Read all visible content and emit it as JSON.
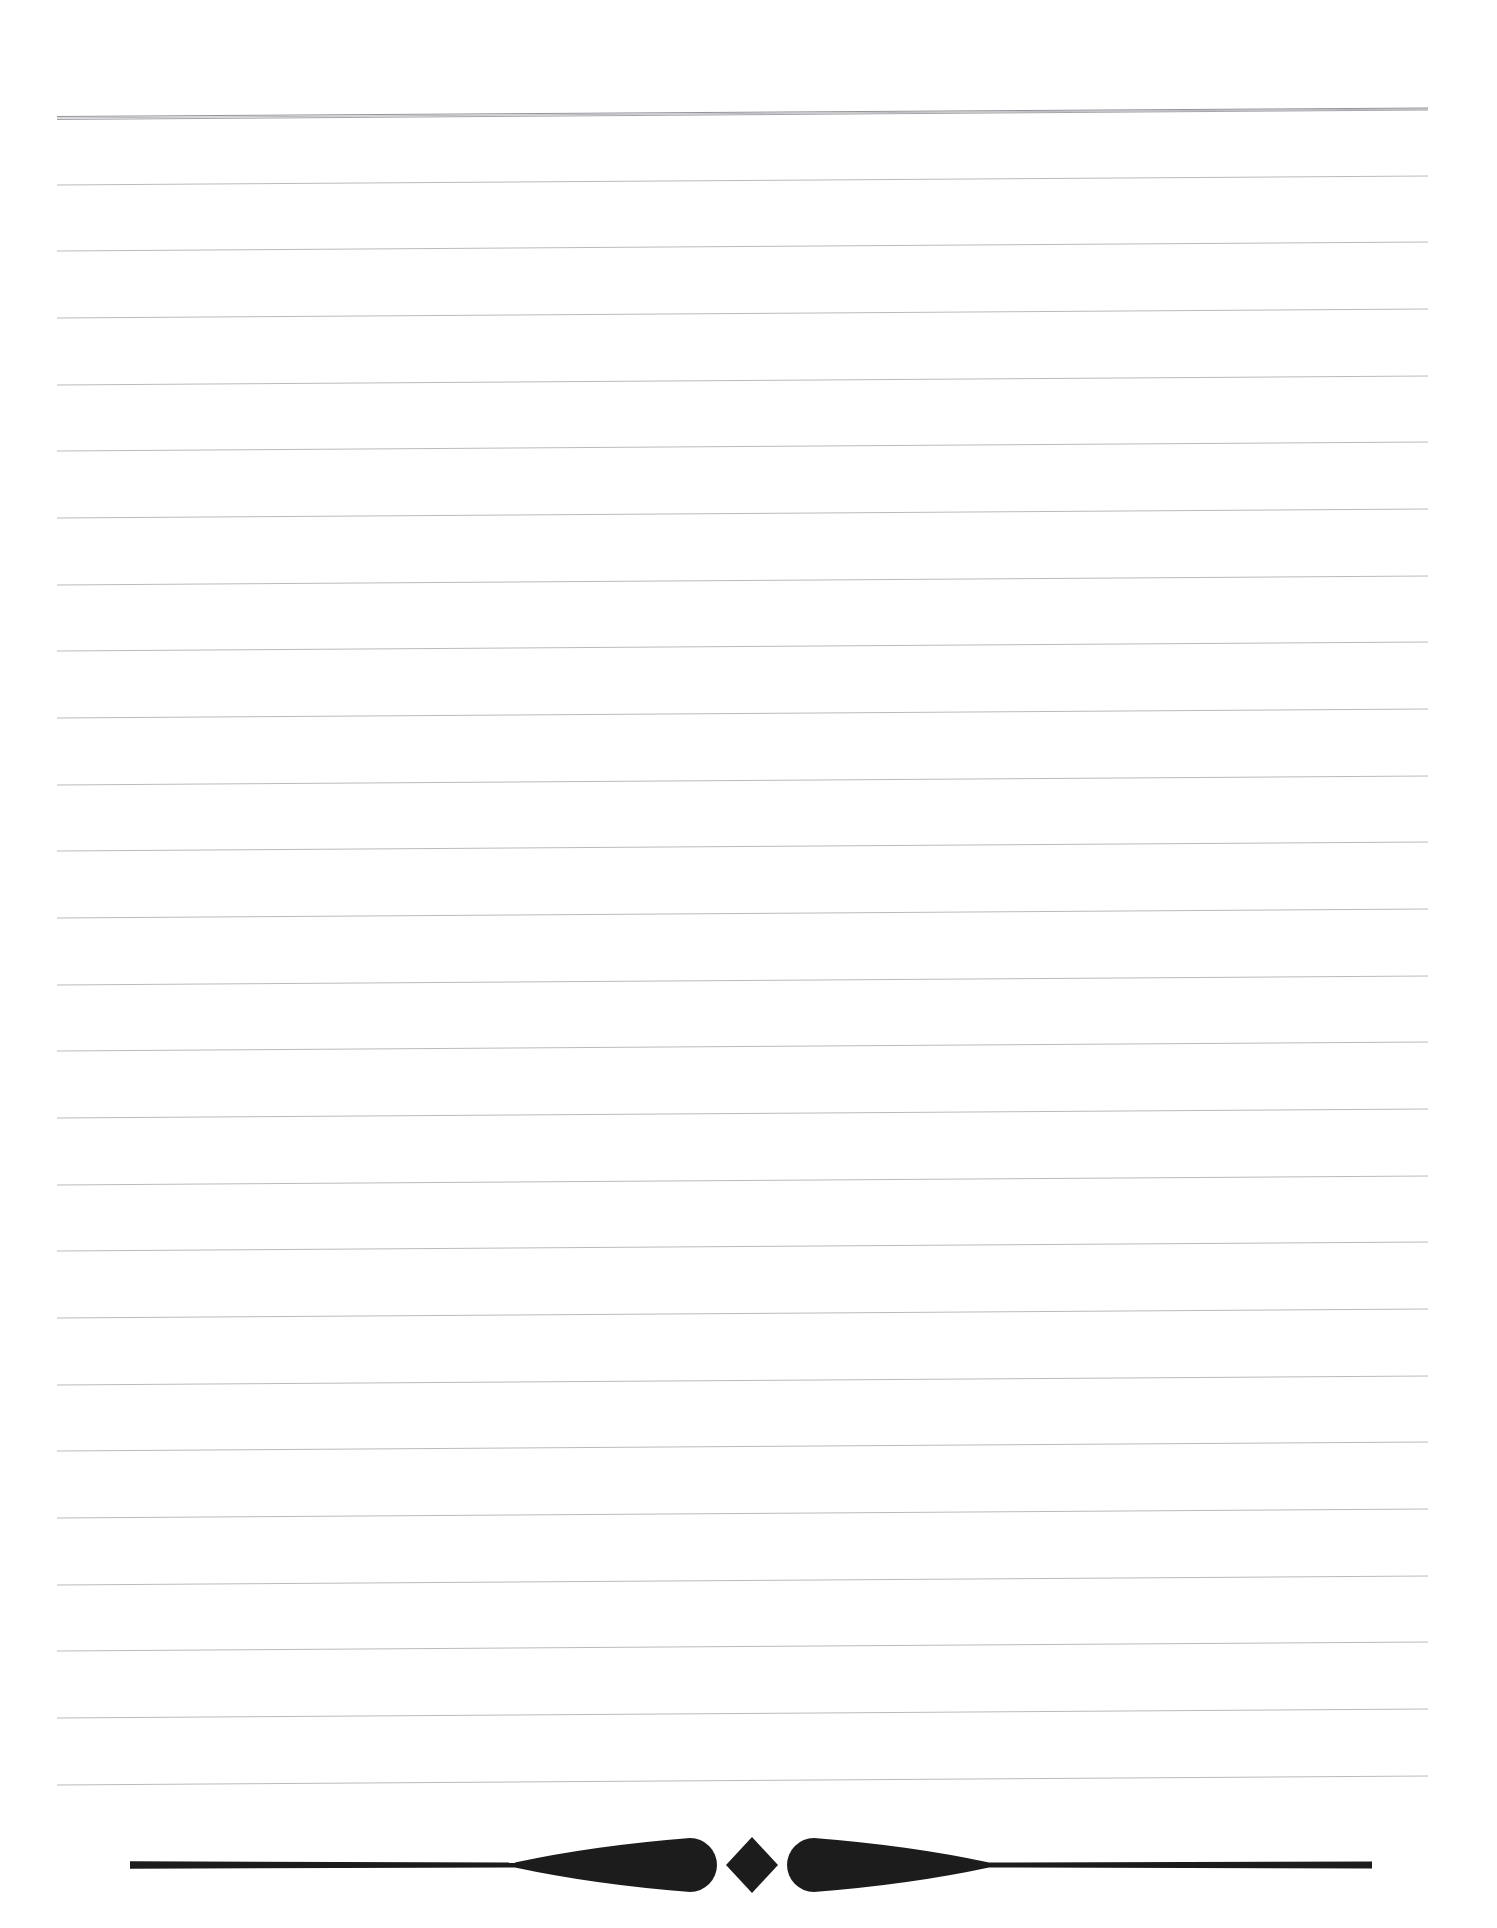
{
  "document": {
    "title": "Blank Ruled Notebook Page",
    "kind": "scanned-lined-stationery",
    "page_width": 1497,
    "page_height": 1928,
    "background_color": "#ffffff",
    "body_text": ""
  },
  "ruling": {
    "name": "horizontal-ruled-lines",
    "count": 26,
    "line_color": "#b4b4b8",
    "first_line_color": "#8e8e95",
    "first_line_doubled": true,
    "stroke_width": 1,
    "left_x": 57,
    "right_x": 1428,
    "first_line_y_left": 118,
    "spacing_px": 66.6,
    "slope_rise_px": -9,
    "description": "Faint grey horizontal rules spanning the page, tilted slightly upward toward the right edge as in a skewed scan.",
    "line_y_left": [
      118,
      185,
      251,
      318,
      385,
      451,
      518,
      585,
      651,
      718,
      785,
      851,
      918,
      985,
      1051,
      1118,
      1185,
      1251,
      1318,
      1385,
      1451,
      1518,
      1585,
      1651,
      1718,
      1785
    ]
  },
  "ornament": {
    "name": "decorative-divider",
    "color": "#1c1c1c",
    "center_x": 752,
    "center_y": 1865,
    "left_rule_start_x": 130,
    "right_rule_end_x": 1372,
    "rule_thickness": 5,
    "diamond_half_width": 26,
    "diamond_half_height": 28,
    "teardrop_tail_span": 175,
    "teardrop_bulb_radius": 27,
    "description": "Typographic fleuron: a solid lozenge flanked by two tapering teardrops that fade into thin horizontal rules reaching toward the page margins."
  },
  "annotations": {
    "marginalia": "",
    "handwriting": "",
    "page_number": ""
  }
}
